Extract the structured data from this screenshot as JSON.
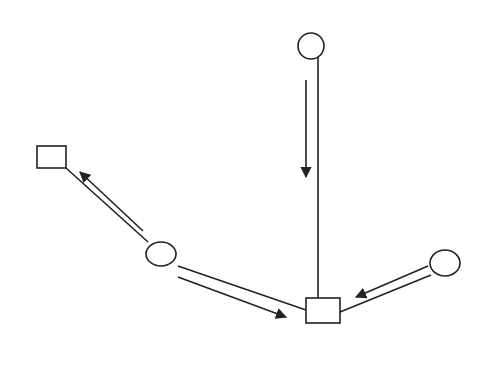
{
  "diagram": {
    "type": "flow-graph",
    "stroke_color": "#222222",
    "background": "#ffffff",
    "nodes": [
      {
        "id": "circle-top",
        "shape": "circle",
        "cx": 311,
        "cy": 46,
        "rx": 13,
        "ry": 13
      },
      {
        "id": "square-left",
        "shape": "square",
        "x": 37,
        "y": 146,
        "w": 29,
        "h": 22
      },
      {
        "id": "circle-middle",
        "shape": "circle",
        "cx": 161,
        "cy": 254,
        "rx": 15,
        "ry": 12
      },
      {
        "id": "square-bottom",
        "shape": "square",
        "x": 306,
        "y": 298,
        "w": 34,
        "h": 25
      },
      {
        "id": "circle-right",
        "shape": "circle",
        "cx": 445,
        "cy": 263,
        "rx": 15,
        "ry": 13
      }
    ],
    "edges": [
      {
        "from": "circle-top",
        "to": "square-bottom",
        "direction": "down"
      },
      {
        "from": "circle-middle",
        "to": "square-left",
        "direction": "up-left"
      },
      {
        "from": "circle-middle",
        "to": "square-bottom",
        "direction": "down-right"
      },
      {
        "from": "circle-right",
        "to": "square-bottom",
        "direction": "down-left"
      }
    ]
  }
}
